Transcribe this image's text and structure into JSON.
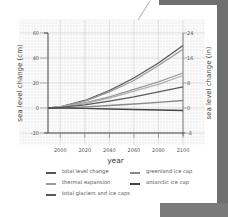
{
  "chart_data": {
    "type": "line",
    "title": "",
    "xlabel": "year",
    "ylabel": "sea level change (cm)",
    "ylabel_right": "sea level change (in)",
    "xlim": [
      1990,
      2100
    ],
    "ylim": [
      -20,
      60
    ],
    "ylim_right": [
      -8,
      24
    ],
    "x_ticks": [
      2000,
      2020,
      2040,
      2060,
      2080,
      2100
    ],
    "y_ticks": [
      -20,
      0,
      20,
      40,
      60
    ],
    "y_ticks_right": [
      -8,
      0,
      8,
      16,
      24
    ],
    "grid": true,
    "legend_position": "bottom",
    "x": [
      1990,
      2000,
      2020,
      2040,
      2060,
      2080,
      2100
    ],
    "series": [
      {
        "name": "total level change",
        "color": "#555555",
        "values": [
          0,
          1,
          6,
          14,
          24,
          36,
          50
        ]
      },
      {
        "name": "total level change (alt)",
        "color": "#9a9a9a",
        "values": [
          0,
          1,
          5.5,
          13,
          22,
          34,
          47
        ]
      },
      {
        "name": "thermal expansion",
        "color": "#9a9a9a",
        "values": [
          0,
          0.8,
          4,
          9,
          15,
          21,
          28
        ]
      },
      {
        "name": "thermal expansion (alt)",
        "color": "#b0b0b0",
        "values": [
          0,
          0.7,
          3.6,
          8,
          13.5,
          19,
          26
        ]
      },
      {
        "name": "total glaciers and ice caps",
        "color": "#5a5a5a",
        "values": [
          0,
          0.5,
          2.5,
          5.5,
          9,
          13,
          17
        ]
      },
      {
        "name": "greenland ice cap",
        "color": "#8a8a8a",
        "values": [
          0,
          0.2,
          1,
          2,
          3.2,
          4.6,
          6
        ]
      },
      {
        "name": "antarctic ice cap",
        "color": "#444444",
        "values": [
          0,
          0,
          -0.3,
          -0.8,
          -1.2,
          -1.6,
          -2
        ]
      }
    ]
  },
  "legend": {
    "items": [
      {
        "label": "total level change",
        "color": "#555555"
      },
      {
        "label": "thermal expansion",
        "color": "#9a9a9a"
      },
      {
        "label": "total glaciers and ice caps",
        "color": "#5a5a5a"
      },
      {
        "label": "greenland ice cap",
        "color": "#8a8a8a"
      },
      {
        "label": "antarctic ice cap",
        "color": "#444444"
      }
    ]
  }
}
